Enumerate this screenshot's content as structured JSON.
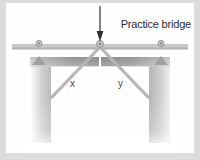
{
  "figure": {
    "title": "Practice bridge",
    "background_color": "#fefefe",
    "page_margin_color": "#dcdcdc",
    "member_color": "#b9b9b9",
    "deck_color": "#c9c9c9",
    "pier_color": "#8f8f8f",
    "arrow_color": "#3a3a3a",
    "label_color": "#3a3a3a"
  },
  "labels": {
    "left_diagonal": "x",
    "right_diagonal": "y"
  },
  "icons": {
    "load_arrow": "down-arrow-icon",
    "left_support": "pin-support-icon",
    "center_joint": "pin-joint-icon",
    "right_support": "pin-support-icon"
  },
  "structure": {
    "deck_label": "bridge-deck",
    "left_pier_label": "left-pier",
    "right_pier_label": "right-pier",
    "left_diagonal_label": "left-diagonal-member",
    "right_diagonal_label": "right-diagonal-member"
  }
}
